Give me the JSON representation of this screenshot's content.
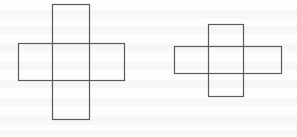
{
  "figure": {
    "background_color": "#fdfdfd",
    "stroke_color": "#5a5a5a",
    "stroke_width": 1.2,
    "canvas": {
      "width": 297,
      "height": 137
    },
    "shapes": [
      {
        "id": "left-cross",
        "label": "Left cross figure",
        "rectangles": [
          {
            "id": "left-horizontal-rect",
            "orientation": "horizontal",
            "x": 18,
            "y": 43,
            "width": 106,
            "height": 37
          },
          {
            "id": "left-vertical-rect",
            "orientation": "vertical",
            "x": 52,
            "y": 4,
            "width": 37,
            "height": 115
          }
        ]
      },
      {
        "id": "right-cross",
        "label": "Right cross figure",
        "rectangles": [
          {
            "id": "right-horizontal-rect",
            "orientation": "horizontal",
            "x": 174,
            "y": 46,
            "width": 107,
            "height": 27
          },
          {
            "id": "right-vertical-rect",
            "orientation": "vertical",
            "x": 208,
            "y": 24,
            "width": 35,
            "height": 72
          }
        ]
      }
    ],
    "scan_artifacts": {
      "note": "Faint horizontal ghost-text bands from page bleed-through",
      "band_color": "#f2f2f2",
      "bands": [
        {
          "y": 10,
          "height": 9
        },
        {
          "y": 26,
          "height": 8
        },
        {
          "y": 44,
          "height": 8
        },
        {
          "y": 62,
          "height": 8
        },
        {
          "y": 80,
          "height": 8
        },
        {
          "y": 98,
          "height": 8
        },
        {
          "y": 116,
          "height": 9
        },
        {
          "y": 130,
          "height": 6
        }
      ]
    }
  }
}
